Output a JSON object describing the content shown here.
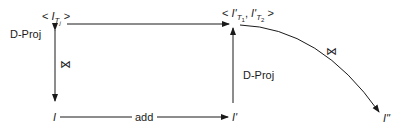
{
  "diagram": {
    "nodes": {
      "top_left": {
        "prefix": "< ",
        "base": "I",
        "sub": "T",
        "subsub": "j",
        "suffix": " >"
      },
      "top_right": {
        "prefix": "< ",
        "items": [
          {
            "base": "I'",
            "sub": "T",
            "subsub": "1"
          },
          {
            "base": "I'",
            "sub": "T",
            "subsub": "2"
          }
        ],
        "separator": ", ",
        "suffix": " >"
      },
      "bottom_left": "I",
      "bottom_middle": "I'",
      "bottom_right": "I\""
    },
    "edges": {
      "left_vertical_label": "D-Proj",
      "left_vertical_symbol": "⋈",
      "right_vertical_label": "D-Proj",
      "bottom_label": "add",
      "curve_symbol": "⋈"
    },
    "colors": {
      "stroke": "#1a1a1a"
    }
  }
}
